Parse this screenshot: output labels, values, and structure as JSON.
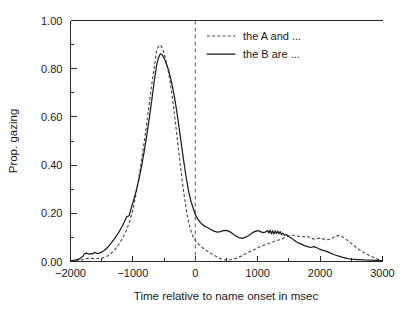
{
  "chart_data": {
    "type": "line",
    "title": "",
    "xlabel": "Time relative to name onset in msec",
    "ylabel": "Prop. gazing",
    "xlim": [
      -2000,
      3000
    ],
    "ylim": [
      0.0,
      1.0
    ],
    "xticks": [
      -2000,
      -1000,
      0,
      1000,
      2000,
      3000
    ],
    "xtick_labels": [
      "−2000",
      "−1000",
      "0",
      "1000",
      "2000",
      "3000"
    ],
    "yticks": [
      0.0,
      0.2,
      0.4,
      0.6,
      0.8,
      1.0
    ],
    "ytick_labels": [
      "0.00",
      "0.20",
      "0.40",
      "0.60",
      "0.80",
      "1.00"
    ],
    "y_minor_ticks": [
      0.1,
      0.3,
      0.5,
      0.7,
      0.9
    ],
    "x_minor_ticks": [
      -1500,
      -500,
      500,
      1500,
      2500
    ],
    "grid": false,
    "legend_position": "top-center-right",
    "annotations": [
      {
        "name": "name-onset-vertical-line",
        "type": "vline",
        "x": 0,
        "style": "dashed",
        "color": "#6e6e6e"
      }
    ],
    "series": [
      {
        "name": "the A and ...",
        "style": "dashed",
        "color": "#4a4a4a",
        "x": [
          -2000,
          -1950,
          -1900,
          -1850,
          -1800,
          -1750,
          -1700,
          -1650,
          -1600,
          -1550,
          -1500,
          -1450,
          -1400,
          -1350,
          -1300,
          -1250,
          -1200,
          -1150,
          -1100,
          -1050,
          -1000,
          -950,
          -900,
          -850,
          -800,
          -750,
          -700,
          -650,
          -620,
          -580,
          -550,
          -520,
          -480,
          -440,
          -400,
          -360,
          -320,
          -280,
          -240,
          -200,
          -160,
          -120,
          -80,
          -40,
          0,
          40,
          80,
          120,
          160,
          200,
          250,
          300,
          350,
          400,
          450,
          500,
          550,
          600,
          650,
          700,
          750,
          800,
          850,
          900,
          950,
          1000,
          1050,
          1100,
          1150,
          1200,
          1250,
          1300,
          1350,
          1400,
          1450,
          1500,
          1550,
          1600,
          1650,
          1700,
          1750,
          1800,
          1850,
          1900,
          1950,
          2000,
          2050,
          2100,
          2150,
          2200,
          2250,
          2300,
          2350,
          2400,
          2450,
          2500,
          2550,
          2600,
          2650,
          2700,
          2750,
          2800,
          2850,
          2900,
          2950,
          3000
        ],
        "y": [
          0.003,
          0.004,
          0.005,
          0.006,
          0.008,
          0.012,
          0.013,
          0.012,
          0.012,
          0.013,
          0.014,
          0.018,
          0.024,
          0.034,
          0.046,
          0.062,
          0.082,
          0.105,
          0.132,
          0.168,
          0.215,
          0.28,
          0.355,
          0.44,
          0.53,
          0.63,
          0.73,
          0.82,
          0.875,
          0.898,
          0.895,
          0.88,
          0.845,
          0.8,
          0.74,
          0.665,
          0.58,
          0.49,
          0.4,
          0.315,
          0.24,
          0.18,
          0.135,
          0.105,
          0.088,
          0.075,
          0.065,
          0.056,
          0.048,
          0.042,
          0.034,
          0.026,
          0.019,
          0.013,
          0.008,
          0.005,
          0.006,
          0.009,
          0.013,
          0.018,
          0.024,
          0.031,
          0.038,
          0.044,
          0.05,
          0.056,
          0.063,
          0.068,
          0.072,
          0.077,
          0.082,
          0.086,
          0.09,
          0.095,
          0.101,
          0.107,
          0.109,
          0.107,
          0.105,
          0.104,
          0.102,
          0.104,
          0.098,
          0.093,
          0.095,
          0.098,
          0.094,
          0.09,
          0.092,
          0.097,
          0.106,
          0.108,
          0.104,
          0.095,
          0.086,
          0.075,
          0.064,
          0.054,
          0.045,
          0.037,
          0.03,
          0.024,
          0.018,
          0.012,
          0.006,
          0.002
        ]
      },
      {
        "name": "the B are ...",
        "style": "solid",
        "color": "#1d1d1d",
        "x": [
          -2000,
          -1950,
          -1900,
          -1850,
          -1800,
          -1780,
          -1750,
          -1720,
          -1700,
          -1670,
          -1640,
          -1620,
          -1600,
          -1570,
          -1540,
          -1500,
          -1460,
          -1420,
          -1380,
          -1340,
          -1300,
          -1260,
          -1220,
          -1180,
          -1140,
          -1100,
          -1060,
          -1020,
          -980,
          -940,
          -900,
          -860,
          -820,
          -780,
          -740,
          -700,
          -660,
          -620,
          -590,
          -560,
          -530,
          -500,
          -470,
          -430,
          -390,
          -350,
          -310,
          -270,
          -230,
          -190,
          -150,
          -110,
          -70,
          -30,
          0,
          40,
          80,
          120,
          160,
          200,
          250,
          300,
          350,
          400,
          450,
          500,
          550,
          600,
          650,
          700,
          750,
          800,
          850,
          900,
          950,
          1000,
          1040,
          1080,
          1120,
          1160,
          1180,
          1200,
          1220,
          1240,
          1260,
          1280,
          1300,
          1320,
          1340,
          1360,
          1380,
          1400,
          1430,
          1460,
          1500,
          1540,
          1580,
          1620,
          1660,
          1700,
          1750,
          1800,
          1850,
          1900,
          1950,
          2000,
          2050,
          2100,
          2150,
          2200,
          2250,
          2300,
          2350,
          2400,
          2450,
          2500,
          2550,
          2600,
          2650,
          2700,
          2800,
          2900,
          3000
        ],
        "y": [
          0.004,
          0.005,
          0.007,
          0.012,
          0.022,
          0.031,
          0.035,
          0.032,
          0.031,
          0.033,
          0.032,
          0.038,
          0.036,
          0.033,
          0.035,
          0.039,
          0.046,
          0.055,
          0.066,
          0.079,
          0.093,
          0.108,
          0.124,
          0.142,
          0.163,
          0.186,
          0.19,
          0.228,
          0.262,
          0.3,
          0.345,
          0.398,
          0.455,
          0.52,
          0.59,
          0.665,
          0.745,
          0.815,
          0.845,
          0.862,
          0.858,
          0.845,
          0.825,
          0.795,
          0.755,
          0.705,
          0.645,
          0.575,
          0.5,
          0.425,
          0.355,
          0.295,
          0.25,
          0.218,
          0.195,
          0.176,
          0.162,
          0.152,
          0.145,
          0.14,
          0.133,
          0.126,
          0.122,
          0.124,
          0.128,
          0.129,
          0.124,
          0.115,
          0.106,
          0.099,
          0.096,
          0.1,
          0.107,
          0.116,
          0.124,
          0.128,
          0.125,
          0.12,
          0.122,
          0.128,
          0.118,
          0.13,
          0.115,
          0.128,
          0.114,
          0.127,
          0.116,
          0.126,
          0.115,
          0.124,
          0.112,
          0.118,
          0.108,
          0.112,
          0.104,
          0.097,
          0.089,
          0.082,
          0.076,
          0.072,
          0.066,
          0.062,
          0.058,
          0.062,
          0.057,
          0.05,
          0.046,
          0.042,
          0.037,
          0.031,
          0.026,
          0.022,
          0.018,
          0.015,
          0.012,
          0.01,
          0.009,
          0.008,
          0.008,
          0.007,
          0.006,
          0.005,
          0.004
        ]
      }
    ]
  },
  "legend": {
    "items": [
      {
        "label": "the A and ...",
        "style": "dashed"
      },
      {
        "label": "the B are ...",
        "style": "solid"
      }
    ]
  },
  "axes": {
    "x_title": "Time relative to name onset in msec",
    "y_title": "Prop. gazing"
  }
}
